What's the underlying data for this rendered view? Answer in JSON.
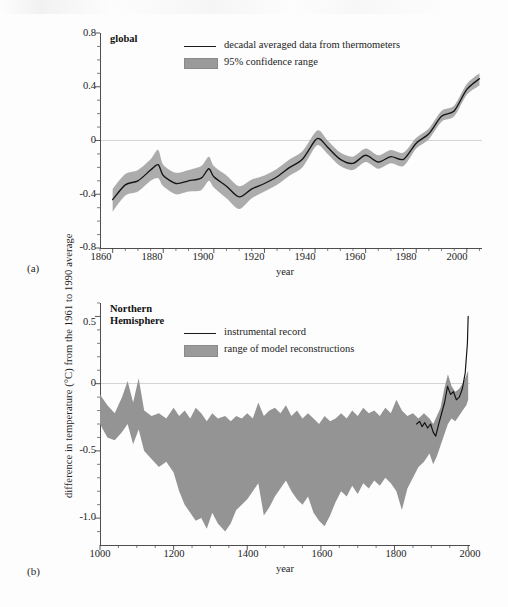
{
  "figure": {
    "y_axis_label": "difference in temperature (°C) from the 1961 to 1990 average",
    "panel_a_tag": "(a)",
    "panel_b_tag": "(b)"
  },
  "panel_a": {
    "title": "global",
    "xlabel": "year",
    "legend": [
      {
        "label": "decadal averaged data from thermometers",
        "marker": "line",
        "color": "#151515"
      },
      {
        "label": "95% confidence range",
        "marker": "band",
        "color": "#9d9d9d"
      }
    ],
    "y_ticks": [
      "0.8",
      "0.4",
      "0",
      "-0.4",
      "-0.8"
    ],
    "x_ticks": [
      "1860",
      "1880",
      "1900",
      "1920",
      "1940",
      "1960",
      "1980",
      "2000"
    ]
  },
  "panel_b": {
    "title": "Northern\nHemisphere",
    "xlabel": "year",
    "legend": [
      {
        "label": "instrumental record",
        "marker": "line",
        "color": "#111111"
      },
      {
        "label": "range of model reconstructions",
        "marker": "band",
        "color": "#949494"
      }
    ],
    "y_ticks": [
      "0.5",
      "0",
      "-0.5",
      "-1.0"
    ],
    "x_ticks": [
      "1000",
      "1200",
      "1400",
      "1600",
      "1800",
      "2000"
    ]
  },
  "chart_data": [
    {
      "id": "panel_a",
      "type": "line",
      "title": "global",
      "xlabel": "year",
      "ylabel": "difference in temperature (°C) from the 1961 to 1990 average",
      "xlim": [
        1855,
        2006
      ],
      "ylim": [
        -0.8,
        0.8
      ],
      "y_major_ticks": [
        -0.8,
        -0.4,
        0,
        0.4,
        0.8
      ],
      "y_minor_step": 0.1,
      "x_major_ticks": [
        1860,
        1880,
        1900,
        1920,
        1940,
        1960,
        1980,
        2000
      ],
      "x_minor_step": 5,
      "grid": false,
      "zero_reference_line": 0,
      "legend_position": "top-center",
      "series": [
        {
          "name": "decadal averaged data from thermometers",
          "type": "line",
          "color": "#151515",
          "x": [
            1860,
            1865,
            1870,
            1875,
            1878,
            1880,
            1885,
            1890,
            1895,
            1898,
            1900,
            1905,
            1910,
            1915,
            1920,
            1925,
            1930,
            1935,
            1940,
            1942,
            1945,
            1950,
            1955,
            1960,
            1965,
            1970,
            1975,
            1980,
            1985,
            1990,
            1995,
            2000,
            2005
          ],
          "y": [
            -0.44,
            -0.33,
            -0.3,
            -0.22,
            -0.18,
            -0.26,
            -0.32,
            -0.3,
            -0.28,
            -0.21,
            -0.27,
            -0.34,
            -0.42,
            -0.36,
            -0.32,
            -0.27,
            -0.2,
            -0.14,
            0.0,
            0.01,
            -0.05,
            -0.14,
            -0.17,
            -0.11,
            -0.16,
            -0.12,
            -0.14,
            -0.02,
            0.05,
            0.18,
            0.22,
            0.38,
            0.46
          ]
        },
        {
          "name": "95% confidence range",
          "type": "band",
          "color": "#9d9d9d",
          "x": [
            1860,
            1865,
            1870,
            1875,
            1878,
            1880,
            1885,
            1890,
            1895,
            1898,
            1900,
            1905,
            1910,
            1915,
            1920,
            1925,
            1930,
            1935,
            1940,
            1942,
            1945,
            1950,
            1955,
            1960,
            1965,
            1970,
            1975,
            1980,
            1985,
            1990,
            1995,
            2000,
            2005
          ],
          "y_upper": [
            -0.36,
            -0.25,
            -0.22,
            -0.14,
            -0.07,
            -0.18,
            -0.24,
            -0.22,
            -0.19,
            -0.12,
            -0.19,
            -0.26,
            -0.34,
            -0.29,
            -0.26,
            -0.21,
            -0.14,
            -0.08,
            0.06,
            0.07,
            0.0,
            -0.09,
            -0.12,
            -0.06,
            -0.11,
            -0.07,
            -0.09,
            0.02,
            0.09,
            0.22,
            0.26,
            0.42,
            0.5
          ],
          "y_lower": [
            -0.53,
            -0.41,
            -0.38,
            -0.3,
            -0.28,
            -0.34,
            -0.4,
            -0.38,
            -0.37,
            -0.3,
            -0.35,
            -0.43,
            -0.51,
            -0.43,
            -0.38,
            -0.33,
            -0.26,
            -0.2,
            -0.05,
            -0.04,
            -0.1,
            -0.19,
            -0.22,
            -0.16,
            -0.21,
            -0.17,
            -0.19,
            -0.06,
            0.01,
            0.14,
            0.18,
            0.34,
            0.41
          ]
        }
      ]
    },
    {
      "id": "panel_b",
      "type": "line",
      "title": "Northern Hemisphere",
      "xlabel": "year",
      "ylabel": "difference in temperature (°C) from the 1961 to 1990 average",
      "xlim": [
        1000,
        2005
      ],
      "ylim": [
        -1.2,
        0.6
      ],
      "y_major_ticks": [
        -1.0,
        -0.5,
        0,
        0.5
      ],
      "y_minor_step": 0.1,
      "x_major_ticks": [
        1000,
        1200,
        1400,
        1600,
        1800,
        2000
      ],
      "x_minor_step": 50,
      "grid": false,
      "zero_reference_line": 0,
      "legend_position": "top-center",
      "series": [
        {
          "name": "range of model reconstructions",
          "type": "band",
          "color": "#949494",
          "x": [
            1000,
            1020,
            1040,
            1060,
            1075,
            1090,
            1105,
            1120,
            1140,
            1160,
            1180,
            1200,
            1215,
            1230,
            1245,
            1260,
            1275,
            1290,
            1305,
            1320,
            1340,
            1355,
            1370,
            1385,
            1400,
            1415,
            1430,
            1445,
            1460,
            1475,
            1490,
            1505,
            1520,
            1535,
            1550,
            1565,
            1580,
            1595,
            1610,
            1625,
            1640,
            1655,
            1670,
            1685,
            1700,
            1715,
            1730,
            1745,
            1760,
            1775,
            1790,
            1805,
            1820,
            1835,
            1850,
            1865,
            1880,
            1895,
            1905,
            1915,
            1925,
            1935,
            1945,
            1955,
            1965,
            1975,
            1985,
            1995,
            2000
          ],
          "y_upper": [
            -0.08,
            -0.16,
            -0.22,
            -0.1,
            0.02,
            -0.14,
            0.04,
            -0.2,
            -0.24,
            -0.22,
            -0.26,
            -0.18,
            -0.24,
            -0.2,
            -0.26,
            -0.18,
            -0.22,
            -0.28,
            -0.22,
            -0.26,
            -0.24,
            -0.28,
            -0.24,
            -0.26,
            -0.22,
            -0.26,
            -0.14,
            -0.24,
            -0.2,
            -0.18,
            -0.22,
            -0.16,
            -0.24,
            -0.2,
            -0.26,
            -0.22,
            -0.26,
            -0.3,
            -0.24,
            -0.28,
            -0.26,
            -0.22,
            -0.26,
            -0.2,
            -0.24,
            -0.18,
            -0.22,
            -0.2,
            -0.24,
            -0.18,
            -0.22,
            -0.12,
            -0.2,
            -0.24,
            -0.22,
            -0.26,
            -0.22,
            -0.26,
            -0.3,
            -0.24,
            -0.18,
            -0.04,
            0.07,
            -0.02,
            -0.06,
            -0.04,
            0.0,
            0.06,
            0.1
          ],
          "y_lower": [
            -0.3,
            -0.4,
            -0.42,
            -0.36,
            -0.3,
            -0.45,
            -0.34,
            -0.5,
            -0.56,
            -0.62,
            -0.58,
            -0.66,
            -0.8,
            -0.9,
            -0.96,
            -1.02,
            -1.0,
            -1.08,
            -0.96,
            -1.04,
            -1.1,
            -1.04,
            -0.94,
            -0.9,
            -0.86,
            -0.8,
            -0.74,
            -0.98,
            -0.92,
            -0.84,
            -0.78,
            -0.72,
            -0.8,
            -0.86,
            -0.9,
            -0.84,
            -0.96,
            -1.02,
            -1.06,
            -0.98,
            -0.88,
            -0.8,
            -0.84,
            -0.76,
            -0.82,
            -0.74,
            -0.78,
            -0.72,
            -0.76,
            -0.7,
            -0.74,
            -0.8,
            -0.94,
            -0.78,
            -0.7,
            -0.62,
            -0.58,
            -0.52,
            -0.6,
            -0.54,
            -0.46,
            -0.38,
            -0.3,
            -0.26,
            -0.28,
            -0.24,
            -0.2,
            -0.16,
            -0.12
          ]
        },
        {
          "name": "instrumental record",
          "type": "line",
          "color": "#111111",
          "x": [
            1860,
            1868,
            1875,
            1882,
            1890,
            1898,
            1905,
            1912,
            1920,
            1928,
            1936,
            1944,
            1952,
            1960,
            1968,
            1976,
            1984,
            1992,
            1998,
            2000
          ],
          "y": [
            -0.3,
            -0.28,
            -0.32,
            -0.29,
            -0.33,
            -0.3,
            -0.36,
            -0.39,
            -0.3,
            -0.22,
            -0.14,
            -0.02,
            -0.08,
            -0.06,
            -0.12,
            -0.1,
            -0.04,
            0.08,
            0.3,
            0.5
          ]
        }
      ]
    }
  ]
}
